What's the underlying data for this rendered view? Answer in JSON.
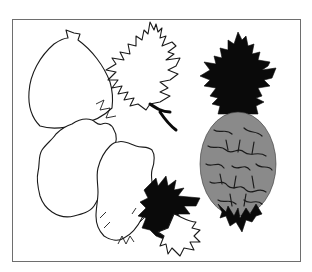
{
  "illustration": {
    "description": "Framed line-art illustration of overlapping leaves and a pineapple-like fruit",
    "frame": {
      "border_color": "#6e6e6e",
      "background": "#ffffff"
    },
    "elements": [
      {
        "name": "fig-outline",
        "style": "outline",
        "color": "#1a1a1a"
      },
      {
        "name": "oak-leaf-outline",
        "style": "outline",
        "color": "#1a1a1a"
      },
      {
        "name": "scalloped-leaf-outline-left",
        "style": "outline",
        "color": "#1a1a1a"
      },
      {
        "name": "scalloped-leaf-outline-center",
        "style": "outline",
        "color": "#1a1a1a"
      },
      {
        "name": "oak-leaf-black-lower",
        "style": "solid",
        "color": "#0a0a0a"
      },
      {
        "name": "small-oak-leaf-outline-bottom",
        "style": "outline",
        "color": "#1a1a1a"
      },
      {
        "name": "pineapple-crown",
        "style": "solid",
        "color": "#0a0a0a"
      },
      {
        "name": "pineapple-body",
        "style": "textured",
        "color": "#8a8a8a"
      },
      {
        "name": "pineapple-base-bracts",
        "style": "solid",
        "color": "#0a0a0a"
      }
    ]
  }
}
